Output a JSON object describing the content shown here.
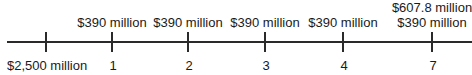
{
  "timeline": {
    "points": [
      {
        "period": "",
        "bottom_label": "$2,500 million",
        "top_labels": []
      },
      {
        "period": "1",
        "bottom_label": "1",
        "top_labels": [
          "$390 million"
        ]
      },
      {
        "period": "2",
        "bottom_label": "2",
        "top_labels": [
          "$390 million"
        ]
      },
      {
        "period": "3",
        "bottom_label": "3",
        "top_labels": [
          "$390 million"
        ]
      },
      {
        "period": "4",
        "bottom_label": "4",
        "top_labels": [
          "$390 million"
        ]
      },
      {
        "period": "7",
        "bottom_label": "7",
        "top_labels": [
          "$607.8 million",
          "$390 million"
        ]
      }
    ]
  }
}
